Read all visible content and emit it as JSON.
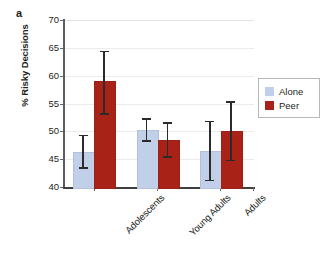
{
  "panel": {
    "label": "a"
  },
  "chart_data": {
    "type": "bar",
    "title": "",
    "subtitle": "",
    "xlabel": "",
    "ylabel": "% Risky Decisions",
    "ylim": [
      40,
      70
    ],
    "ytick_step": 5,
    "yticks": [
      70,
      65,
      60,
      55,
      50,
      45,
      40
    ],
    "ytick_labels": [
      "70",
      "65",
      "60",
      "55",
      "50",
      "45",
      "40"
    ],
    "grid": true,
    "grid_axis": "y",
    "legend_position": "right",
    "categories": [
      "Adolescents",
      "Young Adults",
      "Adults"
    ],
    "series": [
      {
        "name": "Alone",
        "color": "#c2cfe9",
        "values": [
          46.3,
          50.2,
          46.4
        ],
        "error_low": [
          43.2,
          48.1,
          41.0
        ],
        "error_high": [
          49.4,
          52.4,
          51.9
        ]
      },
      {
        "name": "Peer",
        "color": "#a82218",
        "values": [
          59.0,
          48.5,
          50.1
        ],
        "error_low": [
          52.9,
          45.2,
          44.6
        ],
        "error_high": [
          64.5,
          51.7,
          55.4
        ]
      }
    ],
    "error_bar_style": "capped-whisker",
    "error_bar_color": "#2b2b2b",
    "annotations": []
  },
  "legend": {
    "entries": [
      {
        "label": "Alone",
        "color": "#c2cfe9"
      },
      {
        "label": "Peer",
        "color": "#a82218"
      }
    ]
  }
}
